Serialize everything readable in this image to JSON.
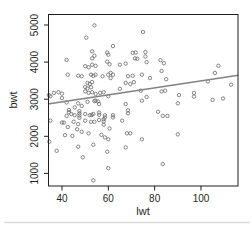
{
  "window": {
    "background": "#ffffff",
    "edge_shadow_color": "#d9d9d9"
  },
  "chart_data": {
    "type": "scatter",
    "title": "",
    "xlabel": "lwt",
    "ylabel": "bwt",
    "x_ticks": [
      40,
      60,
      80,
      100
    ],
    "y_ticks": [
      1000,
      2000,
      3000,
      4000,
      5000
    ],
    "xlim": [
      33.9,
      116.1
    ],
    "ylim": [
      660,
      5300
    ],
    "grid": false,
    "legend": "none",
    "marker": "open-circle",
    "colors": {
      "points": "#676767",
      "trendline": "#828282",
      "axis": "#1f1f1f"
    },
    "trendline": {
      "x1": 33.9,
      "y1": 2870,
      "x2": 116.1,
      "y2": 3645
    },
    "points": [
      [
        54,
        4990
      ],
      [
        50.5,
        4660
      ],
      [
        53,
        4290
      ],
      [
        54,
        4170
      ],
      [
        53,
        4100
      ],
      [
        59.5,
        4260
      ],
      [
        60,
        4200
      ],
      [
        42,
        4060
      ],
      [
        59.5,
        4010
      ],
      [
        60.5,
        3940
      ],
      [
        50,
        3890
      ],
      [
        51.5,
        3860
      ],
      [
        53,
        3930
      ],
      [
        54.5,
        3900
      ],
      [
        42.5,
        3660
      ],
      [
        47,
        3630
      ],
      [
        48.5,
        3620
      ],
      [
        52.5,
        3660
      ],
      [
        53.5,
        3630
      ],
      [
        54.5,
        3660
      ],
      [
        57.5,
        3620
      ],
      [
        60,
        3660
      ],
      [
        61,
        3710
      ],
      [
        51,
        3440
      ],
      [
        52,
        3410
      ],
      [
        53,
        3460
      ],
      [
        50,
        3330
      ],
      [
        51,
        3290
      ],
      [
        52.5,
        3320
      ],
      [
        36.5,
        3170
      ],
      [
        38.5,
        3190
      ],
      [
        40,
        3150
      ],
      [
        34.3,
        3110
      ],
      [
        35,
        3080
      ],
      [
        50,
        3210
      ],
      [
        51.5,
        3170
      ],
      [
        53,
        3190
      ],
      [
        54.5,
        3140
      ],
      [
        56.5,
        3170
      ],
      [
        58,
        3190
      ],
      [
        60,
        3080
      ],
      [
        40,
        3030
      ],
      [
        75,
        4810
      ],
      [
        62,
        4430
      ],
      [
        70.5,
        4250
      ],
      [
        71.8,
        4260
      ],
      [
        76,
        4270
      ],
      [
        76,
        4150
      ],
      [
        76.5,
        4000
      ],
      [
        82.5,
        4050
      ],
      [
        84,
        3970
      ],
      [
        83,
        3760
      ],
      [
        65,
        3930
      ],
      [
        67.5,
        3960
      ],
      [
        71.5,
        4100
      ],
      [
        72.5,
        4090
      ],
      [
        62,
        3660
      ],
      [
        61,
        3570
      ],
      [
        68.5,
        3620
      ],
      [
        70.5,
        3630
      ],
      [
        74.5,
        3660
      ],
      [
        78,
        3570
      ],
      [
        85,
        3540
      ],
      [
        67.5,
        3440
      ],
      [
        69.5,
        3410
      ],
      [
        71,
        3460
      ],
      [
        65,
        3280
      ],
      [
        74,
        3230
      ],
      [
        83,
        3210
      ],
      [
        84.5,
        3230
      ],
      [
        76.5,
        3060
      ],
      [
        107.5,
        3900
      ],
      [
        106,
        3710
      ],
      [
        103,
        3480
      ],
      [
        113,
        3390
      ],
      [
        97,
        3170
      ],
      [
        90.5,
        3110
      ],
      [
        97,
        3070
      ],
      [
        105,
        2980
      ],
      [
        109.5,
        3020
      ],
      [
        42,
        2910
      ],
      [
        47,
        2890
      ],
      [
        45.5,
        2780
      ],
      [
        48.5,
        2820
      ],
      [
        51,
        2930
      ],
      [
        54.5,
        2960
      ],
      [
        54,
        2950
      ],
      [
        55.5,
        2940
      ],
      [
        56,
        2870
      ],
      [
        43,
        2710
      ],
      [
        43,
        2650
      ],
      [
        42,
        2550
      ],
      [
        44,
        2600
      ],
      [
        45.5,
        2570
      ],
      [
        47.5,
        2680
      ],
      [
        47.5,
        2620
      ],
      [
        47.5,
        2560
      ],
      [
        47.5,
        2500
      ],
      [
        50,
        2600
      ],
      [
        52,
        2570
      ],
      [
        52.8,
        2575
      ],
      [
        53.5,
        2600
      ],
      [
        56,
        2640
      ],
      [
        56,
        2580
      ],
      [
        58.5,
        2570
      ],
      [
        58.5,
        2510
      ],
      [
        35,
        2420
      ],
      [
        40,
        2370
      ],
      [
        40.8,
        2370
      ],
      [
        45,
        2390
      ],
      [
        47,
        2330
      ],
      [
        50,
        2420
      ],
      [
        52.5,
        2390
      ],
      [
        54,
        2390
      ],
      [
        56,
        2440
      ],
      [
        58,
        2460
      ],
      [
        58,
        2400
      ],
      [
        58,
        2310
      ],
      [
        46.5,
        2190
      ],
      [
        48.5,
        2120
      ],
      [
        51.5,
        2080
      ],
      [
        44.5,
        2010
      ],
      [
        41.3,
        2030
      ],
      [
        57,
        2040
      ],
      [
        58.5,
        1970
      ],
      [
        60,
        1920
      ],
      [
        34.5,
        1855
      ],
      [
        42.5,
        2250
      ],
      [
        37.7,
        1610
      ],
      [
        47,
        1720
      ],
      [
        53.5,
        1770
      ],
      [
        59.5,
        1585
      ],
      [
        49,
        1435
      ],
      [
        60,
        1140
      ],
      [
        53.5,
        810
      ],
      [
        67.5,
        2870
      ],
      [
        74.5,
        2960
      ],
      [
        62,
        2570
      ],
      [
        62,
        2510
      ],
      [
        68.5,
        2700
      ],
      [
        68.5,
        2620
      ],
      [
        81.5,
        2660
      ],
      [
        83.5,
        2550
      ],
      [
        85.5,
        2550
      ],
      [
        66,
        2420
      ],
      [
        60.5,
        2210
      ],
      [
        68,
        2080
      ],
      [
        69.5,
        2080
      ],
      [
        74.5,
        1920
      ],
      [
        67.5,
        1700
      ],
      [
        83.5,
        1250
      ],
      [
        90,
        2890
      ],
      [
        90,
        2050
      ]
    ]
  },
  "layout_note": ""
}
